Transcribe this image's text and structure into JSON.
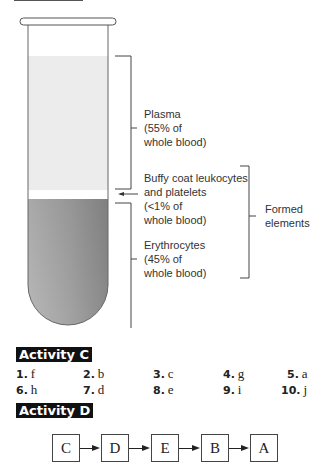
{
  "diagram": {
    "plasma": {
      "name": "Plasma",
      "detail1": "(55% of",
      "detail2": "whole blood)"
    },
    "buffy": {
      "name1": "Buffy coat leukocytes",
      "name2": "and platelets",
      "detail1": "(<1% of",
      "detail2": "whole blood)"
    },
    "erythrocytes": {
      "name": "Erythrocytes",
      "detail1": "(45% of",
      "detail2": "whole blood)"
    },
    "formed": {
      "line1": "Formed",
      "line2": "elements"
    },
    "colors": {
      "plasma": "#ececec",
      "buffy": "#ffffff",
      "erythrocytes": "#9a9a9a"
    }
  },
  "activity_c": {
    "title": "Activity C",
    "answers": [
      {
        "num": "1.",
        "letter": "f"
      },
      {
        "num": "2.",
        "letter": "b"
      },
      {
        "num": "3.",
        "letter": "c"
      },
      {
        "num": "4.",
        "letter": "g"
      },
      {
        "num": "5.",
        "letter": "a"
      },
      {
        "num": "6.",
        "letter": "h"
      },
      {
        "num": "7.",
        "letter": "d"
      },
      {
        "num": "8.",
        "letter": "e"
      },
      {
        "num": "9.",
        "letter": "i"
      },
      {
        "num": "10.",
        "letter": "j"
      }
    ]
  },
  "activity_d": {
    "title": "Activity D",
    "sequence": [
      "C",
      "D",
      "E",
      "B",
      "A"
    ]
  }
}
